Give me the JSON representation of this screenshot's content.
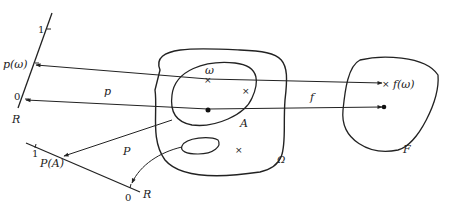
{
  "diagram": {
    "type": "probability-mapping-diagram",
    "labels": {
      "axis_top_one": "1",
      "axis_top_zero": "0",
      "axis_top_R": "R",
      "p_omega": "p(ω)",
      "p_map": "p",
      "omega_point": "ω",
      "f_map": "f",
      "f_omega": "f(ω)",
      "set_A": "A",
      "sample_space": "Ω",
      "set_F": "F",
      "P_map": "P",
      "axis_bottom_one": "1",
      "axis_bottom_zero": "0",
      "axis_bottom_R": "R",
      "P_A": "P(A)"
    },
    "colors": {
      "stroke": "#222222",
      "background": "#ffffff"
    }
  }
}
